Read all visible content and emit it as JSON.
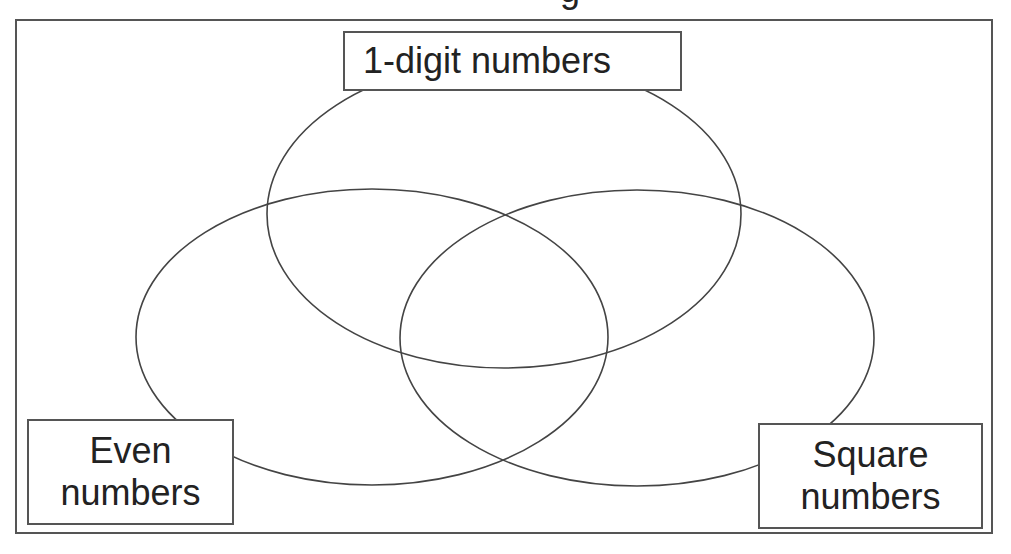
{
  "title": {
    "visible_fragment": "g",
    "note": "Top title text is cropped; only a descender is visible"
  },
  "diagram": {
    "type": "venn",
    "sets": [
      {
        "id": "one-digit",
        "label": "1-digit numbers",
        "label_lines": [
          "1-digit numbers"
        ],
        "ellipse": {
          "cx": 504,
          "cy": 214,
          "rx": 237,
          "ry": 154
        }
      },
      {
        "id": "even",
        "label": "Even numbers",
        "label_lines": [
          "Even",
          "numbers"
        ],
        "ellipse": {
          "cx": 372,
          "cy": 337,
          "rx": 236,
          "ry": 148
        }
      },
      {
        "id": "square",
        "label": "Square numbers",
        "label_lines": [
          "Square",
          "numbers"
        ],
        "ellipse": {
          "cx": 637,
          "cy": 338,
          "rx": 237,
          "ry": 148
        }
      }
    ],
    "colors": {
      "stroke": "#444444",
      "background": "#ffffff",
      "text": "#222222"
    }
  }
}
